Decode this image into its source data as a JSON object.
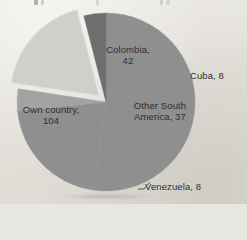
{
  "chart_data": {
    "type": "pie",
    "title": "",
    "categories": [
      "Own country",
      "Colombia",
      "Cuba",
      "Other South America",
      "Venezuela"
    ],
    "values": [
      104,
      42,
      8,
      37,
      8
    ],
    "total": 199,
    "labels": [
      "Own country, 104",
      "Colombia, 42",
      "Cuba, 8",
      "Other South America, 37",
      "Venezuela, 8"
    ],
    "slices": [
      {
        "name": "Own country",
        "value": 104,
        "label": "Own country,",
        "label_line2": "104",
        "color": "#8f8f8f",
        "exploded": false,
        "start_angle": 167.4,
        "end_angle": 360.0,
        "label_position": "inside-left"
      },
      {
        "name": "Colombia",
        "value": 42,
        "label": "Colombia,",
        "label_line2": "42",
        "color": "#8f8f8f",
        "exploded": false,
        "start_angle": 0.0,
        "end_angle": 75.9,
        "label_position": "inside-top-right"
      },
      {
        "name": "Cuba",
        "value": 8,
        "label": "Cuba, 8",
        "color": "#a2a2a2",
        "exploded": false,
        "start_angle": 75.9,
        "end_angle": 90.4,
        "label_position": "outside-right"
      },
      {
        "name": "Other South America",
        "value": 37,
        "label": "Other South",
        "label_line2": "America, 37",
        "color": "#cfcfcb",
        "exploded": true,
        "start_angle": 90.4,
        "end_angle": 157.3,
        "label_position": "inside-right"
      },
      {
        "name": "Venezuela",
        "value": 8,
        "label": "Venezuela, 8",
        "color": "#6e6e6e",
        "exploded": false,
        "start_angle": 152.9,
        "end_angle": 167.4,
        "label_position": "outside-bottom-right"
      }
    ],
    "legend": "none",
    "grid": false,
    "xlabel": "",
    "ylabel": "",
    "background_color": "#e5e2dc",
    "label_color": "#2e2e2e",
    "start_angle_deg": 0,
    "direction": "clockwise",
    "center": [
      106,
      102
    ],
    "radius": 89
  }
}
